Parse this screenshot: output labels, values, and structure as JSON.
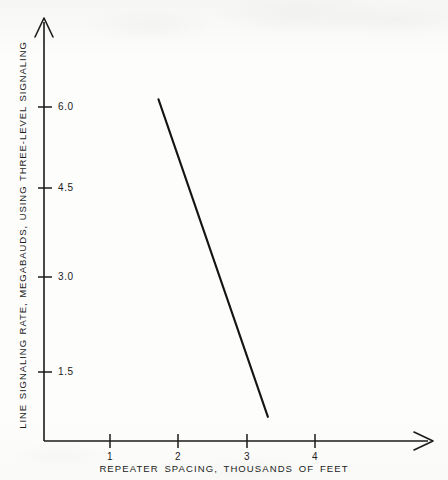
{
  "chart_data": {
    "type": "line",
    "title": "",
    "xlabel": "REPEATER SPACING, THOUSANDS OF FEET",
    "ylabel": "LINE SIGNALING RATE, MEGABAUDS, USING THREE-LEVEL SIGNALING",
    "xlim": [
      0,
      4.75
    ],
    "ylim": [
      0,
      7.1
    ],
    "xticks": [
      1,
      2,
      3,
      4
    ],
    "xtick_labels": [
      "1",
      "2",
      "3",
      "4"
    ],
    "yticks": [
      1.5,
      3.0,
      4.5,
      6.0
    ],
    "ytick_labels": [
      "1.5",
      "3.0",
      "4.5",
      "6.0"
    ],
    "grid": false,
    "legend": null,
    "axis_style": "arrow-tipped",
    "series": [
      {
        "name": "line-signaling-rate",
        "color": "#141414",
        "x": [
          1.71,
          3.31
        ],
        "y": [
          6.13,
          0.74
        ]
      }
    ]
  },
  "axes": {
    "y_axis_name": "y-axis",
    "x_axis_name": "x-axis"
  }
}
